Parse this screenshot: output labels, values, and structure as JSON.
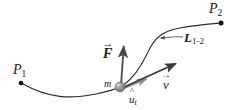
{
  "figure": {
    "title_alt": "Particle of mass m moving along curve from P1 to P2 under force F",
    "background_color": "#fdfdfd",
    "stroke_color": "#2b2b2b",
    "vector_color": "#4a4a4a",
    "mass_color": "#8c8c8c"
  },
  "labels": {
    "point_start": "P",
    "point_start_sub": "1",
    "point_end": "P",
    "point_end_sub": "2",
    "mass": "m",
    "force": "F",
    "force_accent": "→",
    "velocity": "v",
    "velocity_accent": "→",
    "unit_tangent": "u",
    "unit_tangent_accent": "^",
    "unit_tangent_sub": "t",
    "path": "L",
    "path_sub": "1-2"
  },
  "geometry": {
    "p1_point": {
      "x": 21,
      "y": 83
    },
    "p2_point": {
      "x": 221,
      "y": 23
    },
    "mass_point": {
      "x": 120,
      "y": 87
    },
    "mass_radius": 5,
    "force_arrow": {
      "x1": 121,
      "y1": 86,
      "x2": 124,
      "y2": 43
    },
    "velocity_arrow": {
      "x1": 122,
      "y1": 88,
      "x2": 179,
      "y2": 62
    },
    "unit_tangent_arrow": {
      "x1": 122,
      "y1": 89,
      "x2": 149,
      "y2": 78
    },
    "leader_line": {
      "x1": 183,
      "y1": 37,
      "x2": 159,
      "y2": 38
    },
    "path_curve": "M21,83 C50,99 70,99 96,94 C110,91 114,90 120,87 C133,80 141,66 148,52 C155,37 163,31 180,28 C196,25 210,24 221,23"
  }
}
